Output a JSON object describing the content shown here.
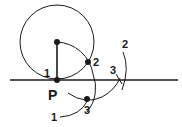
{
  "diagram": {
    "type": "geometric-construction",
    "colors": {
      "stroke": "#1a1a1a",
      "background": "#ffffff"
    },
    "labels": {
      "point_p": "P",
      "point_1": "1",
      "point_2": "2",
      "point_3": "3",
      "arc_2_label": "2",
      "arc_3_label": "3",
      "arc_1_label": "1"
    }
  }
}
